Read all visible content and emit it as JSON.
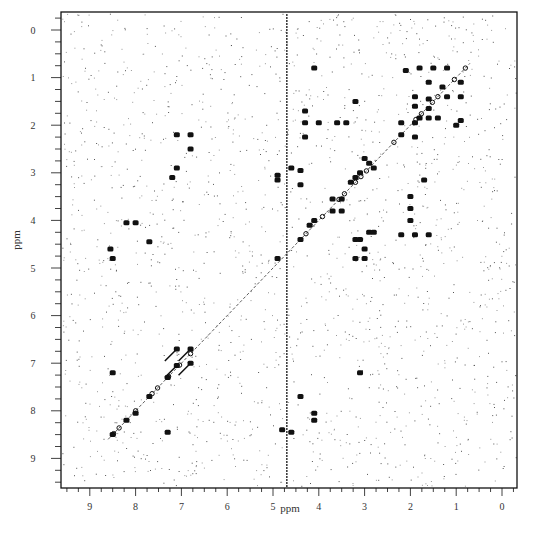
{
  "chart_data": {
    "type": "scatter",
    "subtype": "2D NMR correlation spectrum (contour map)",
    "title": "",
    "xlabel": "ppm",
    "ylabel": "ppm",
    "xlim": [
      9.6,
      -0.3
    ],
    "ylim": [
      9.6,
      -0.3
    ],
    "x_reversed": true,
    "y_reversed": true,
    "x_ticks": [
      "9",
      "8",
      "7",
      "6",
      "5",
      "4",
      "3",
      "2",
      "1",
      "0"
    ],
    "y_ticks": [
      "0",
      "1",
      "2",
      "3",
      "4",
      "5",
      "6",
      "7",
      "8",
      "9"
    ],
    "grid": false,
    "legend": null,
    "artifacts": {
      "solvent_stripe_ppm": 4.7,
      "background_noise": true
    },
    "diagonal": {
      "from": [
        8.6,
        8.6
      ],
      "to": [
        0.7,
        0.7
      ]
    },
    "series": [
      {
        "name": "aliphatic cross-peaks",
        "points": [
          {
            "x": 2.1,
            "y": 0.85
          },
          {
            "x": 1.8,
            "y": 0.8
          },
          {
            "x": 1.5,
            "y": 0.8
          },
          {
            "x": 1.2,
            "y": 0.8
          },
          {
            "x": 1.6,
            "y": 1.1
          },
          {
            "x": 1.3,
            "y": 1.2
          },
          {
            "x": 0.9,
            "y": 1.1
          },
          {
            "x": 1.9,
            "y": 1.4
          },
          {
            "x": 1.6,
            "y": 1.45
          },
          {
            "x": 1.2,
            "y": 1.4
          },
          {
            "x": 0.9,
            "y": 1.4
          },
          {
            "x": 1.9,
            "y": 1.6
          },
          {
            "x": 1.6,
            "y": 1.65
          },
          {
            "x": 1.8,
            "y": 1.85
          },
          {
            "x": 1.6,
            "y": 1.85
          },
          {
            "x": 1.4,
            "y": 1.85
          },
          {
            "x": 0.9,
            "y": 1.9
          },
          {
            "x": 2.2,
            "y": 1.95
          },
          {
            "x": 1.9,
            "y": 1.95
          },
          {
            "x": 1.0,
            "y": 2.0
          },
          {
            "x": 2.2,
            "y": 2.2
          },
          {
            "x": 1.9,
            "y": 2.25
          },
          {
            "x": 4.3,
            "y": 1.7
          },
          {
            "x": 4.3,
            "y": 1.95
          },
          {
            "x": 4.0,
            "y": 1.95
          },
          {
            "x": 3.6,
            "y": 1.95
          },
          {
            "x": 3.4,
            "y": 1.95
          },
          {
            "x": 4.3,
            "y": 2.25
          },
          {
            "x": 3.2,
            "y": 1.5
          },
          {
            "x": 4.1,
            "y": 0.8
          }
        ]
      },
      {
        "name": "mid-field cross-peaks",
        "points": [
          {
            "x": 4.6,
            "y": 2.9
          },
          {
            "x": 4.4,
            "y": 2.95
          },
          {
            "x": 4.4,
            "y": 3.25
          },
          {
            "x": 4.9,
            "y": 3.05
          },
          {
            "x": 4.9,
            "y": 3.15
          },
          {
            "x": 3.0,
            "y": 2.7
          },
          {
            "x": 2.9,
            "y": 2.8
          },
          {
            "x": 2.8,
            "y": 2.9
          },
          {
            "x": 3.1,
            "y": 3.0
          },
          {
            "x": 3.2,
            "y": 3.1
          },
          {
            "x": 3.3,
            "y": 3.2
          },
          {
            "x": 3.7,
            "y": 3.55
          },
          {
            "x": 3.5,
            "y": 3.55
          },
          {
            "x": 3.7,
            "y": 3.8
          },
          {
            "x": 3.5,
            "y": 3.8
          },
          {
            "x": 2.0,
            "y": 3.5
          },
          {
            "x": 2.0,
            "y": 3.75
          },
          {
            "x": 2.0,
            "y": 4.0
          },
          {
            "x": 1.7,
            "y": 3.15
          },
          {
            "x": 2.2,
            "y": 4.3
          },
          {
            "x": 1.9,
            "y": 4.3
          },
          {
            "x": 1.6,
            "y": 4.3
          },
          {
            "x": 2.9,
            "y": 4.25
          },
          {
            "x": 2.8,
            "y": 4.25
          },
          {
            "x": 3.2,
            "y": 4.4
          },
          {
            "x": 3.1,
            "y": 4.4
          },
          {
            "x": 3.0,
            "y": 4.6
          },
          {
            "x": 3.2,
            "y": 4.8
          },
          {
            "x": 3.0,
            "y": 4.8
          },
          {
            "x": 4.9,
            "y": 4.8
          },
          {
            "x": 4.4,
            "y": 4.4
          },
          {
            "x": 4.2,
            "y": 4.1
          },
          {
            "x": 4.1,
            "y": 4.0
          }
        ]
      },
      {
        "name": "aromatic / amide cross-peaks",
        "points": [
          {
            "x": 8.2,
            "y": 4.05
          },
          {
            "x": 8.0,
            "y": 4.05
          },
          {
            "x": 7.7,
            "y": 4.45
          },
          {
            "x": 8.55,
            "y": 4.6
          },
          {
            "x": 8.5,
            "y": 4.8
          },
          {
            "x": 7.1,
            "y": 6.7
          },
          {
            "x": 6.8,
            "y": 6.7
          },
          {
            "x": 7.1,
            "y": 7.05
          },
          {
            "x": 6.8,
            "y": 7.0
          },
          {
            "x": 7.3,
            "y": 7.3
          },
          {
            "x": 8.5,
            "y": 7.2
          },
          {
            "x": 7.3,
            "y": 8.45
          },
          {
            "x": 7.7,
            "y": 7.7
          },
          {
            "x": 8.0,
            "y": 8.05
          },
          {
            "x": 8.2,
            "y": 8.2
          },
          {
            "x": 8.5,
            "y": 8.5
          },
          {
            "x": 4.4,
            "y": 7.7
          },
          {
            "x": 4.1,
            "y": 8.05
          },
          {
            "x": 4.1,
            "y": 8.2
          },
          {
            "x": 4.8,
            "y": 8.4
          },
          {
            "x": 4.6,
            "y": 8.45
          },
          {
            "x": 3.1,
            "y": 7.2
          },
          {
            "x": 7.2,
            "y": 3.1
          },
          {
            "x": 7.1,
            "y": 2.9
          },
          {
            "x": 6.8,
            "y": 2.5
          },
          {
            "x": 7.1,
            "y": 2.2
          },
          {
            "x": 6.8,
            "y": 2.2
          }
        ]
      }
    ]
  },
  "axes": {
    "x_title": "ppm",
    "y_title": "ppm"
  }
}
